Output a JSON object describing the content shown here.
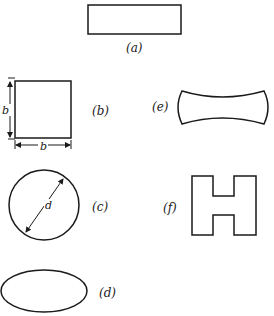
{
  "figure": {
    "shapes": [
      {
        "id": "a",
        "label": "(a)",
        "kind": "rectangle"
      },
      {
        "id": "b",
        "label": "(b)",
        "kind": "square",
        "dimension_labels": {
          "side_vertical": "b",
          "side_horizontal": "b"
        }
      },
      {
        "id": "c",
        "label": "(c)",
        "kind": "circle",
        "dimension_labels": {
          "diameter": "d"
        }
      },
      {
        "id": "d",
        "label": "(d)",
        "kind": "ellipse"
      },
      {
        "id": "e",
        "label": "(e)",
        "kind": "concave-sided bar"
      },
      {
        "id": "f",
        "label": "(f)",
        "kind": "H-section"
      }
    ]
  }
}
